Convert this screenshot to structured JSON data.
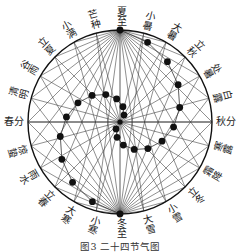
{
  "caption": "图3  二十四节气图",
  "colors": {
    "ink": "#111111",
    "line": "#333333",
    "text": "#222222"
  },
  "center_label": "",
  "solar_terms": [
    {
      "name": "夏至",
      "position": "top"
    },
    {
      "name": "小暑"
    },
    {
      "name": "大暑"
    },
    {
      "name": "立秋"
    },
    {
      "name": "处暑"
    },
    {
      "name": "白露"
    },
    {
      "name": "秋分",
      "position": "right"
    },
    {
      "name": "寒露"
    },
    {
      "name": "霜降"
    },
    {
      "name": "立冬"
    },
    {
      "name": "小雪"
    },
    {
      "name": "大雪"
    },
    {
      "name": "冬至",
      "position": "bottom"
    },
    {
      "name": "小寒"
    },
    {
      "name": "大寒"
    },
    {
      "name": "立春"
    },
    {
      "name": "雨水"
    },
    {
      "name": "惊蛰"
    },
    {
      "name": "春分",
      "position": "left"
    },
    {
      "name": "清明"
    },
    {
      "name": "谷雨"
    },
    {
      "name": "立夏"
    },
    {
      "name": "小满"
    },
    {
      "name": "芒种"
    }
  ]
}
